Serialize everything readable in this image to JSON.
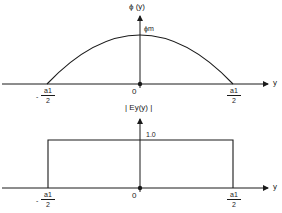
{
  "diagram": {
    "top_plot": {
      "y_axis_label": "ϕ (y)",
      "peak_label": "ϕm",
      "x_axis_label": "y",
      "origin_label": "0",
      "left_tick": {
        "sign": "-",
        "numerator": "a1",
        "denominator": "2"
      },
      "right_tick": {
        "numerator": "a1",
        "denominator": "2"
      },
      "curve": "parabolic arc from -a1/2 to a1/2 with maximum ϕm at y=0"
    },
    "bottom_plot": {
      "y_axis_label": "| Ey(y) |",
      "level_label": "1.0",
      "x_axis_label": "y",
      "origin_label": "0",
      "left_tick": {
        "sign": "-",
        "numerator": "a1",
        "denominator": "2"
      },
      "right_tick": {
        "numerator": "a1",
        "denominator": "2"
      },
      "curve": "rectangular pulse of height 1.0 from -a1/2 to a1/2"
    },
    "colors": {
      "line": "#1a1a1a",
      "background": "#ffffff"
    }
  }
}
